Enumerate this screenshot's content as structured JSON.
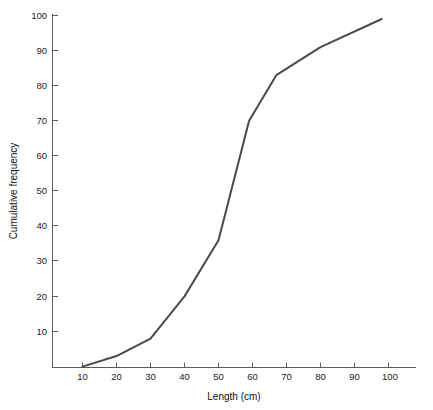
{
  "chart_data": {
    "type": "line",
    "title": "",
    "subtitle": "",
    "xlabel": "Length (cm)",
    "ylabel": "Cumulative frequency",
    "xlim": [
      0,
      110
    ],
    "ylim": [
      0,
      104
    ],
    "xticks": [
      10,
      20,
      30,
      40,
      50,
      60,
      70,
      80,
      90,
      100
    ],
    "yticks": [
      10,
      20,
      30,
      40,
      50,
      60,
      70,
      80,
      90,
      100
    ],
    "xtick_labels": [
      "10",
      "20",
      "30",
      "40",
      "50",
      "60",
      "70",
      "80",
      "90",
      "100"
    ],
    "ytick_labels": [
      "10",
      "20",
      "30",
      "40",
      "50",
      "60",
      "70",
      "80",
      "90",
      "100"
    ],
    "grid": false,
    "legend": null,
    "series": [
      {
        "name": "Cumulative frequency",
        "color": "#4a4a4a",
        "x": [
          10,
          20,
          30,
          40,
          50,
          59,
          67,
          80,
          98
        ],
        "y": [
          0,
          3,
          8,
          20,
          36,
          70,
          83,
          91,
          99
        ],
        "points": [
          {
            "x": 10,
            "y": 0
          },
          {
            "x": 20,
            "y": 3
          },
          {
            "x": 30,
            "y": 8
          },
          {
            "x": 40,
            "y": 20
          },
          {
            "x": 50,
            "y": 36
          },
          {
            "x": 59,
            "y": 70
          },
          {
            "x": 67,
            "y": 83
          },
          {
            "x": 80,
            "y": 91
          },
          {
            "x": 98,
            "y": 99
          }
        ]
      }
    ]
  },
  "axes": {
    "x_title": "Length (cm)",
    "y_title": "Cumulative frequency",
    "axis_color": "#5b5b5b"
  }
}
